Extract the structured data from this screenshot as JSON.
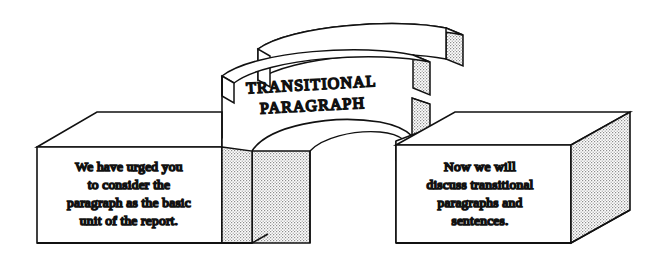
{
  "figure": {
    "type": "isometric-block-diagram",
    "background_color": "#ffffff",
    "line_color": "#111111",
    "fill_color": "#ffffff",
    "stipple_color": "#8d8d8d",
    "title_block": {
      "name": "center-arch-block",
      "label_line_1": "TRANSITIONAL",
      "label_line_2": "PARAGRAPH"
    },
    "left_block": {
      "name": "left-block",
      "lines": [
        "We have urged you",
        "to consider the",
        "paragraph as the basic",
        "unit of the report."
      ]
    },
    "right_block": {
      "name": "right-block",
      "lines": [
        "Now we will",
        "discuss transitional",
        "paragraphs and",
        "sentences."
      ]
    },
    "arches": [
      {
        "name": "upper-arch-band"
      },
      {
        "name": "lower-arch-band"
      }
    ]
  }
}
